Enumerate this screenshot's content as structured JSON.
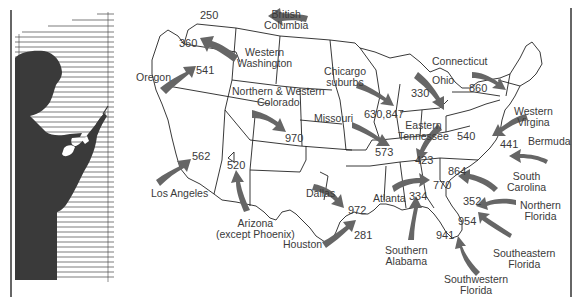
{
  "figure": {
    "type": "illustrated-map",
    "colors": {
      "arrow": "#666666",
      "silhouette": "#3a3a3a",
      "lines": "#222222",
      "background": "#ffffff"
    }
  },
  "regions": [
    {
      "id": "british-columbia",
      "label": "British\nColumbia",
      "code": "250"
    },
    {
      "id": "western-washington",
      "label": "Western\nWashington",
      "code": "360"
    },
    {
      "id": "oregon",
      "label": "Oregon",
      "code": "541"
    },
    {
      "id": "northern-western-colorado",
      "label": "Northern & Western\nColorado",
      "code": "970"
    },
    {
      "id": "los-angeles",
      "label": "Los Angeles",
      "code": "562"
    },
    {
      "id": "arizona",
      "label": "Arizona\n(except Phoenix)",
      "code": "520"
    },
    {
      "id": "chicago-suburbs",
      "label": "Chicargo\nsuburbs",
      "code": "630,847"
    },
    {
      "id": "missouri",
      "label": "Missouri",
      "code": "573"
    },
    {
      "id": "ohio",
      "label": "Ohio",
      "code": "330"
    },
    {
      "id": "connecticut",
      "label": "Connecticut",
      "code": "860"
    },
    {
      "id": "eastern-tennessee",
      "label": "Eastern\nTennessee",
      "code": "423"
    },
    {
      "id": "western-virginia",
      "label": "Western\nVirgina",
      "code": "540"
    },
    {
      "id": "bermuda",
      "label": "Bermuda",
      "code": "441"
    },
    {
      "id": "dallas",
      "label": "Dallas",
      "code": "972"
    },
    {
      "id": "houston",
      "label": "Houston",
      "code": "281"
    },
    {
      "id": "atlanta",
      "label": "Atlanta",
      "code": "770"
    },
    {
      "id": "southern-alabama",
      "label": "Southern\nAlabama",
      "code": "334"
    },
    {
      "id": "south-carolina",
      "label": "South\nCarolina",
      "code": "864"
    },
    {
      "id": "northern-florida",
      "label": "Northern\nFlorida",
      "code": "352"
    },
    {
      "id": "southeastern-florida",
      "label": "Southeastern\nFlorida",
      "code": "954"
    },
    {
      "id": "southwestern-florida",
      "label": "Southwestern\nFlorida",
      "code": "941"
    }
  ],
  "labels": {
    "bc_1": "British",
    "bc_2": "Columbia",
    "ww_1": "Western",
    "ww_2": "Washington",
    "oregon": "Oregon",
    "co_1": "Northern & Western",
    "co_2": "Colorado",
    "la": "Los Angeles",
    "az_1": "Arizona",
    "az_2": "(except Phoenix)",
    "chi_1": "Chicargo",
    "chi_2": "suburbs",
    "missouri": "Missouri",
    "ohio": "Ohio",
    "connecticut": "Connecticut",
    "tn_1": "Eastern",
    "tn_2": "Tennessee",
    "va_1": "Western",
    "va_2": "Virgina",
    "bermuda": "Bermuda",
    "dallas": "Dallas",
    "houston": "Houston",
    "atlanta": "Atlanta",
    "al_1": "Southern",
    "al_2": "Alabama",
    "sc_1": "South",
    "sc_2": "Carolina",
    "nf_1": "Northern",
    "nf_2": "Florida",
    "sef_1": "Southeastern",
    "sef_2": "Florida",
    "swf_1": "Southwestern",
    "swf_2": "Florida"
  },
  "codes": {
    "bc": "250",
    "ww": "360",
    "oregon": "541",
    "co": "970",
    "la": "562",
    "az": "520",
    "chi": "630,847",
    "missouri": "573",
    "ohio": "330",
    "connecticut": "860",
    "tn": "423",
    "va": "540",
    "bermuda": "441",
    "dallas": "972",
    "houston": "281",
    "atlanta": "770",
    "al": "334",
    "sc": "864",
    "nf": "352",
    "sef": "954",
    "swf": "941"
  }
}
